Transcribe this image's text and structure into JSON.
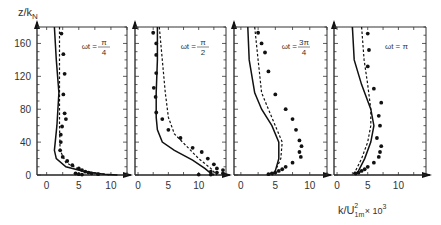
{
  "chart_data": {
    "type": "line",
    "title": "",
    "ylabel": "z/k_N",
    "xlabel": "k/U_1m^2 × 10^3",
    "ylim": [
      0,
      180
    ],
    "yticks": [
      0,
      40,
      80,
      120,
      160
    ],
    "grid": false,
    "legend": null,
    "panels": [
      {
        "annotation": "ωt = π/4",
        "ann_num": "π",
        "ann_den": "4",
        "xlim": [
          -1.5,
          12.5
        ],
        "xticks": [
          0,
          5,
          10
        ],
        "solid": [
          [
            1.2,
            180
          ],
          [
            1.5,
            140
          ],
          [
            1.9,
            100
          ],
          [
            1.6,
            60
          ],
          [
            1.2,
            30
          ],
          [
            1.5,
            20
          ],
          [
            3,
            10
          ],
          [
            6,
            4
          ],
          [
            9,
            1
          ],
          [
            11,
            0
          ]
        ],
        "dashed": [
          [
            2,
            180
          ],
          [
            2,
            140
          ],
          [
            2,
            100
          ],
          [
            2,
            60
          ],
          [
            2.1,
            30
          ],
          [
            3,
            15
          ],
          [
            5,
            7
          ],
          [
            7,
            3
          ],
          [
            10,
            0
          ]
        ],
        "points": [
          [
            2.3,
            172
          ],
          [
            2.6,
            147
          ],
          [
            2.8,
            123
          ],
          [
            2.6,
            98
          ],
          [
            2.8,
            75
          ],
          [
            3.0,
            68
          ],
          [
            2.4,
            59
          ],
          [
            2.2,
            49
          ],
          [
            2.2,
            40
          ],
          [
            2.1,
            30
          ],
          [
            2.5,
            22
          ],
          [
            3.2,
            17
          ],
          [
            4,
            12
          ],
          [
            5,
            8
          ],
          [
            5.5,
            6
          ],
          [
            6,
            4
          ],
          [
            6.5,
            3
          ],
          [
            7,
            2
          ],
          [
            8,
            1
          ],
          [
            4.5,
            2
          ],
          [
            5,
            1
          ],
          [
            5.5,
            0.5
          ]
        ]
      },
      {
        "annotation": "ωt = π/2",
        "ann_num": "π",
        "ann_den": "2",
        "xlim": [
          -0.5,
          14.5
        ],
        "xticks": [
          0,
          5,
          10
        ],
        "solid": [
          [
            3.2,
            180
          ],
          [
            3.2,
            140
          ],
          [
            3.0,
            100
          ],
          [
            3.0,
            70
          ],
          [
            3.2,
            55
          ],
          [
            4,
            40
          ],
          [
            6,
            30
          ],
          [
            9,
            18
          ],
          [
            11,
            8
          ],
          [
            12,
            2
          ],
          [
            12.5,
            0
          ]
        ],
        "dashed": [
          [
            3.5,
            180
          ],
          [
            4,
            140
          ],
          [
            4.5,
            100
          ],
          [
            5,
            70
          ],
          [
            6,
            50
          ],
          [
            8,
            35
          ],
          [
            10,
            20
          ],
          [
            12,
            8
          ],
          [
            13,
            0
          ]
        ],
        "points": [
          [
            2.5,
            173
          ],
          [
            3,
            160
          ],
          [
            3,
            146
          ],
          [
            3,
            124
          ],
          [
            2.6,
            106
          ],
          [
            2.9,
            95
          ],
          [
            3,
            76
          ],
          [
            4,
            68
          ],
          [
            5,
            55
          ],
          [
            7,
            45
          ],
          [
            9,
            33
          ],
          [
            10.5,
            28
          ],
          [
            11.5,
            20
          ],
          [
            12.5,
            13
          ],
          [
            13,
            8
          ],
          [
            14,
            6
          ],
          [
            12,
            4
          ],
          [
            13,
            3
          ],
          [
            14,
            2
          ],
          [
            10,
            0.5
          ],
          [
            12,
            0.5
          ]
        ]
      },
      {
        "annotation": "ωt = 3π/4",
        "ann_num": "3π",
        "ann_den": "4",
        "xlim": [
          -1,
          12.5
        ],
        "xticks": [
          0,
          5,
          10
        ],
        "solid": [
          [
            1,
            180
          ],
          [
            1.2,
            140
          ],
          [
            2,
            100
          ],
          [
            3,
            80
          ],
          [
            4.5,
            60
          ],
          [
            5.5,
            40
          ],
          [
            5.5,
            20
          ],
          [
            5,
            5
          ],
          [
            4.5,
            0
          ]
        ],
        "dashed": [
          [
            2,
            180
          ],
          [
            2.5,
            140
          ],
          [
            3,
            100
          ],
          [
            4,
            80
          ],
          [
            5,
            60
          ],
          [
            6,
            40
          ],
          [
            5.8,
            20
          ],
          [
            5,
            5
          ],
          [
            4.5,
            0
          ]
        ],
        "points": [
          [
            2.5,
            173
          ],
          [
            3,
            160
          ],
          [
            3.5,
            149
          ],
          [
            4,
            126
          ],
          [
            5,
            98
          ],
          [
            6.5,
            80
          ],
          [
            7.5,
            68
          ],
          [
            8,
            55
          ],
          [
            8.5,
            42
          ],
          [
            8.8,
            35
          ],
          [
            8.5,
            28
          ],
          [
            8.7,
            22
          ],
          [
            7.5,
            15
          ],
          [
            6.5,
            10
          ],
          [
            6,
            7
          ],
          [
            5.5,
            5
          ],
          [
            5,
            3
          ],
          [
            4.5,
            2
          ],
          [
            4,
            1
          ]
        ]
      },
      {
        "annotation": "ωt = π",
        "ann_num": "",
        "ann_den": "",
        "xlim": [
          -0.5,
          14.5
        ],
        "xticks": [
          0,
          5,
          10
        ],
        "solid": [
          [
            2.5,
            180
          ],
          [
            2.8,
            140
          ],
          [
            4,
            110
          ],
          [
            5.5,
            80
          ],
          [
            6,
            60
          ],
          [
            5.5,
            40
          ],
          [
            4.5,
            20
          ],
          [
            3.5,
            5
          ],
          [
            3,
            0
          ]
        ],
        "dashed": [
          [
            4,
            180
          ],
          [
            4.4,
            140
          ],
          [
            5,
            110
          ],
          [
            5.5,
            80
          ],
          [
            5.5,
            60
          ],
          [
            5,
            40
          ],
          [
            4,
            20
          ],
          [
            3,
            5
          ],
          [
            2.5,
            0
          ]
        ],
        "points": [
          [
            5,
            172
          ],
          [
            5.2,
            152
          ],
          [
            5,
            132
          ],
          [
            6,
            105
          ],
          [
            7.2,
            88
          ],
          [
            6.8,
            72
          ],
          [
            7,
            60
          ],
          [
            6.5,
            45
          ],
          [
            7.2,
            35
          ],
          [
            7,
            28
          ],
          [
            6.8,
            22
          ],
          [
            6,
            15
          ],
          [
            5,
            10
          ],
          [
            4.5,
            7
          ],
          [
            4,
            5
          ],
          [
            3.5,
            3
          ],
          [
            3,
            2
          ]
        ]
      }
    ]
  },
  "labels": {
    "ylabel_main": "z/k",
    "ylabel_sub": "N",
    "xlabel_pre": "k/U",
    "xlabel_sub": "1m",
    "xlabel_sup": "2",
    "xlabel_post": " × 10",
    "xlabel_exp": "3",
    "omega_t": "ωt = "
  }
}
